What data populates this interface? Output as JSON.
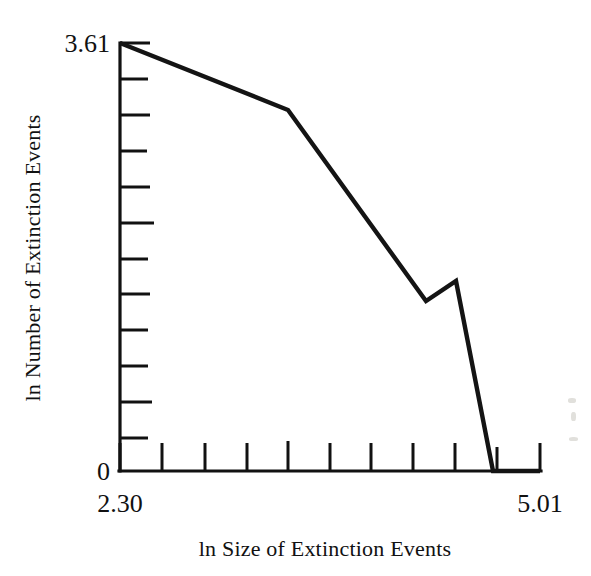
{
  "chart_data": {
    "type": "line",
    "title": "",
    "subtitle": "",
    "xlabel": "ln Size of Extinction Events",
    "ylabel": "ln Number of Extinction Events",
    "xlim": [
      2.3,
      5.01
    ],
    "ylim": [
      0,
      3.61
    ],
    "x_tick_labels": [
      "2.30",
      "5.01"
    ],
    "y_tick_labels": [
      "3.61",
      "0"
    ],
    "x_major_label_left": "2.30",
    "x_major_label_right": "5.01",
    "y_major_label_top": "3.61",
    "y_major_label_bottom": "0",
    "n_x_ticks": 11,
    "n_y_ticks": 12,
    "grid": false,
    "legend": false,
    "legend_position": "none",
    "line_color": "#141414",
    "axis_color": "#111111",
    "background_color": "#ffffff",
    "series": [
      {
        "name": "Extinction event frequency",
        "x": [
          2.3,
          2.99,
          3.55,
          3.68,
          3.83,
          5.01
        ],
        "y": [
          3.61,
          3.05,
          1.43,
          1.6,
          0.0,
          0.0
        ]
      }
    ],
    "points_pixels": [
      [
        120,
        43
      ],
      [
        288,
        110
      ],
      [
        426,
        301
      ],
      [
        456,
        281
      ],
      [
        493,
        471
      ],
      [
        540,
        471
      ]
    ],
    "annotations": []
  },
  "axes": {
    "x_axis_name": "x-axis",
    "y_axis_name": "y-axis",
    "x_title": "ln Size of Extinction Events",
    "y_title": "ln Number of Extinction Events",
    "y_top_value": "3.61",
    "y_bottom_value": "0",
    "x_left_value": "2.30",
    "x_right_value": "5.01"
  }
}
